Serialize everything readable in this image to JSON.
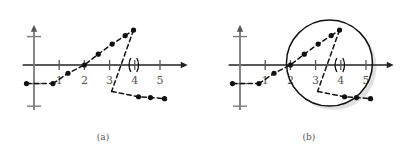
{
  "figure": {
    "panels": [
      {
        "id": "a",
        "caption": "(a)"
      },
      {
        "id": "b",
        "caption": "(b)"
      }
    ]
  },
  "axis": {
    "xticklabels": [
      "1",
      "2",
      "3",
      "4",
      "5"
    ],
    "xtickvalues": [
      1,
      2,
      3,
      4,
      5
    ],
    "yticklabels": [
      "",
      "0",
      "",
      ""
    ],
    "arrow": "arrowhead",
    "origin_label": "0"
  },
  "annotation": {
    "paren_symbol": "()",
    "paren_x": 4,
    "circle_highlight": {
      "center_x": 3.55,
      "center_y": 0.1,
      "radius_px": 43,
      "shadow_color": "#c8c8c8"
    }
  },
  "chart_data": {
    "type": "scatter",
    "title": "",
    "xlabel": "",
    "ylabel": "",
    "xlim": [
      -0.45,
      6.1
    ],
    "ylim": [
      -2.3,
      2.05
    ],
    "grid": false,
    "legend": false,
    "marker": "filled-circle",
    "linestyle": "dashed",
    "color": "#111111",
    "series": [
      {
        "name": "lower-left-branch",
        "x": [
          -0.3,
          0.75
        ],
        "y": [
          -0.95,
          -0.95
        ]
      },
      {
        "name": "rising-branch",
        "x": [
          0.75,
          1.35,
          2.0,
          2.55,
          3.1,
          3.62
        ],
        "y": [
          -0.95,
          -0.42,
          0.0,
          0.55,
          1.07,
          1.5
        ]
      },
      {
        "name": "peak-points",
        "x": [
          3.62,
          3.95
        ],
        "y": [
          1.5,
          1.78
        ]
      },
      {
        "name": "steep-drop",
        "x": [
          3.95,
          3.08
        ],
        "y": [
          1.78,
          -1.35
        ]
      },
      {
        "name": "lower-right-branch",
        "x": [
          3.08,
          4.15,
          4.62,
          5.18
        ],
        "y": [
          -1.35,
          -1.62,
          -1.66,
          -1.72
        ]
      }
    ],
    "points": [
      {
        "x": -0.3,
        "y": -0.95
      },
      {
        "x": 0.75,
        "y": -0.95
      },
      {
        "x": 1.35,
        "y": -0.42
      },
      {
        "x": 2.0,
        "y": 0.0
      },
      {
        "x": 2.55,
        "y": 0.55
      },
      {
        "x": 3.1,
        "y": 1.07
      },
      {
        "x": 3.62,
        "y": 1.5
      },
      {
        "x": 3.95,
        "y": 1.78
      },
      {
        "x": 4.15,
        "y": -1.62
      },
      {
        "x": 4.62,
        "y": -1.66
      },
      {
        "x": 5.18,
        "y": -1.72
      }
    ]
  }
}
